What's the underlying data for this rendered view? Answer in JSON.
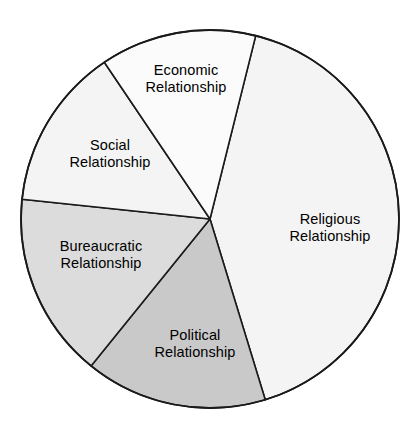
{
  "chart_data": {
    "type": "pie",
    "title": "",
    "subtitle": "",
    "xlabel": "",
    "ylabel": "",
    "legend_position": "none",
    "grid": false,
    "labels_inside": true,
    "center": {
      "x": 210,
      "y": 219
    },
    "radius": 189,
    "outline_color": "#1a1a1a",
    "background_color": "#ffffff",
    "categories": [
      "Religious Relationship",
      "Political Relationship",
      "Bureaucratic Relationship",
      "Social Relationship",
      "Economic Relationship"
    ],
    "values": [
      41.4,
      15.6,
      15.8,
      13.9,
      13.3
    ],
    "units": "percent",
    "slices": [
      {
        "id": "religious",
        "name": "Religious Relationship",
        "label_lines": [
          "Religious",
          "Relationship"
        ],
        "value": 41.4,
        "start_angle_deg": 14,
        "end_angle_deg": 163,
        "sweep_deg": 149,
        "color": "#f4f4f4",
        "label_x": 330,
        "label_y": 228
      },
      {
        "id": "political",
        "name": "Political Relationship",
        "label_lines": [
          "Political",
          "Relationship"
        ],
        "value": 15.6,
        "start_angle_deg": 163,
        "end_angle_deg": 219,
        "sweep_deg": 56,
        "color": "#c9c9c9",
        "label_x": 195,
        "label_y": 344
      },
      {
        "id": "bureaucratic",
        "name": "Bureaucratic Relationship",
        "label_lines": [
          "Bureaucratic",
          "Relationship"
        ],
        "value": 15.8,
        "start_angle_deg": 219,
        "end_angle_deg": 276,
        "sweep_deg": 57,
        "color": "#dcdcdc",
        "label_x": 101,
        "label_y": 255
      },
      {
        "id": "social",
        "name": "Social Relationship",
        "label_lines": [
          "Social",
          "Relationship"
        ],
        "value": 13.9,
        "start_angle_deg": 276,
        "end_angle_deg": 326,
        "sweep_deg": 50,
        "color": "#f4f4f4",
        "label_x": 110,
        "label_y": 154
      },
      {
        "id": "economic",
        "name": "Economic Relationship",
        "label_lines": [
          "Economic",
          "Relationship"
        ],
        "value": 13.3,
        "start_angle_deg": 326,
        "end_angle_deg": 374,
        "sweep_deg": 48,
        "color": "#fbfbfb",
        "label_x": 186,
        "label_y": 79
      }
    ]
  }
}
